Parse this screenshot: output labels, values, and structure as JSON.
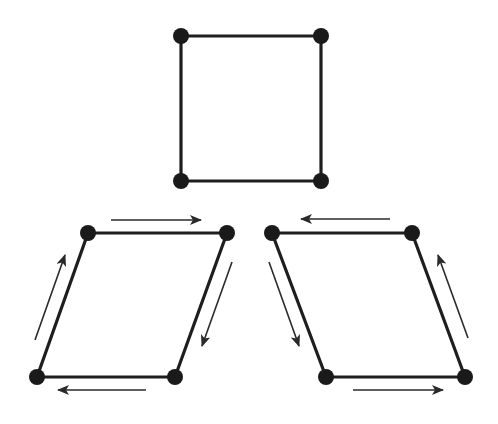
{
  "diagram": {
    "colors": {
      "stroke": "#1e1e1e",
      "vertex": "#1a1a1a",
      "arrow": "#2a2a2a",
      "background": "#ffffff"
    },
    "shapes": [
      {
        "id": "square",
        "vertices": [
          [
            181,
            36
          ],
          [
            321,
            36
          ],
          [
            321,
            181
          ],
          [
            181,
            181
          ]
        ],
        "arrows": []
      },
      {
        "id": "parallelogram-left",
        "vertices": [
          [
            88,
            233
          ],
          [
            227,
            233
          ],
          [
            175,
            377
          ],
          [
            37,
            377
          ]
        ],
        "arrows": [
          {
            "side": "top",
            "direction": "right",
            "from": [
              111,
              220
            ],
            "to": [
              201,
              220
            ]
          },
          {
            "side": "right",
            "direction": "down-left",
            "from": [
              232,
              262
            ],
            "to": [
              202,
              346
            ]
          },
          {
            "side": "bottom",
            "direction": "left",
            "from": [
              146,
              390
            ],
            "to": [
              58,
              390
            ]
          },
          {
            "side": "left",
            "direction": "up-right",
            "from": [
              35,
              340
            ],
            "to": [
              65,
              255
            ]
          }
        ]
      },
      {
        "id": "parallelogram-right",
        "vertices": [
          [
            272,
            233
          ],
          [
            412,
            233
          ],
          [
            465,
            377
          ],
          [
            326,
            377
          ]
        ],
        "arrows": [
          {
            "side": "top",
            "direction": "left",
            "from": [
              390,
              219
            ],
            "to": [
              301,
              219
            ]
          },
          {
            "side": "left",
            "direction": "down-right",
            "from": [
              269,
              262
            ],
            "to": [
              299,
              346
            ]
          },
          {
            "side": "bottom",
            "direction": "right",
            "from": [
              353,
              390
            ],
            "to": [
              443,
              390
            ]
          },
          {
            "side": "right",
            "direction": "up-left",
            "from": [
              468,
              338
            ],
            "to": [
              438,
              255
            ]
          }
        ]
      }
    ]
  }
}
